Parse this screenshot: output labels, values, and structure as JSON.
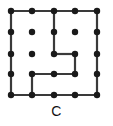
{
  "figure": {
    "caption": "C",
    "type": "dot-grid-path-puzzle",
    "grid": {
      "rows": 5,
      "cols": 5,
      "col_x": [
        11,
        32,
        54,
        75,
        97
      ],
      "row_y": [
        11,
        32,
        54,
        74,
        95
      ],
      "dot_radius": 3.2,
      "dot_color": "#1a1a1a"
    },
    "line": {
      "color": "#3a3a3a",
      "width": 2.2
    },
    "dots": [
      {
        "row": 1,
        "col": 1
      },
      {
        "row": 1,
        "col": 2
      },
      {
        "row": 1,
        "col": 3
      },
      {
        "row": 1,
        "col": 4
      },
      {
        "row": 1,
        "col": 5
      },
      {
        "row": 2,
        "col": 1
      },
      {
        "row": 2,
        "col": 2
      },
      {
        "row": 2,
        "col": 3
      },
      {
        "row": 2,
        "col": 4
      },
      {
        "row": 2,
        "col": 5
      },
      {
        "row": 3,
        "col": 1
      },
      {
        "row": 3,
        "col": 2
      },
      {
        "row": 3,
        "col": 3
      },
      {
        "row": 3,
        "col": 4
      },
      {
        "row": 3,
        "col": 5
      },
      {
        "row": 4,
        "col": 1
      },
      {
        "row": 4,
        "col": 2
      },
      {
        "row": 4,
        "col": 3
      },
      {
        "row": 4,
        "col": 4
      },
      {
        "row": 4,
        "col": 5
      },
      {
        "row": 5,
        "col": 1
      },
      {
        "row": 5,
        "col": 2
      },
      {
        "row": 5,
        "col": 3
      },
      {
        "row": 5,
        "col": 4
      },
      {
        "row": 5,
        "col": 5
      }
    ],
    "segments": [
      {
        "name": "top-edge",
        "from": {
          "row": 1,
          "col": 1
        },
        "to": {
          "row": 1,
          "col": 5
        }
      },
      {
        "name": "left-edge",
        "from": {
          "row": 1,
          "col": 1
        },
        "to": {
          "row": 5,
          "col": 1
        }
      },
      {
        "name": "right-edge",
        "from": {
          "row": 1,
          "col": 5
        },
        "to": {
          "row": 5,
          "col": 5
        }
      },
      {
        "name": "bottom-edge",
        "from": {
          "row": 5,
          "col": 1
        },
        "to": {
          "row": 5,
          "col": 5
        }
      },
      {
        "name": "inner-vertical-col3",
        "from": {
          "row": 1,
          "col": 3
        },
        "to": {
          "row": 3,
          "col": 3
        }
      },
      {
        "name": "inner-horizontal-row3",
        "from": {
          "row": 3,
          "col": 3
        },
        "to": {
          "row": 3,
          "col": 4
        }
      },
      {
        "name": "inner-vertical-col4",
        "from": {
          "row": 3,
          "col": 4
        },
        "to": {
          "row": 4,
          "col": 4
        }
      },
      {
        "name": "inner-horizontal-row4",
        "from": {
          "row": 4,
          "col": 4
        },
        "to": {
          "row": 4,
          "col": 2
        }
      },
      {
        "name": "inner-vertical-col2",
        "from": {
          "row": 4,
          "col": 2
        },
        "to": {
          "row": 5,
          "col": 2
        }
      }
    ]
  }
}
